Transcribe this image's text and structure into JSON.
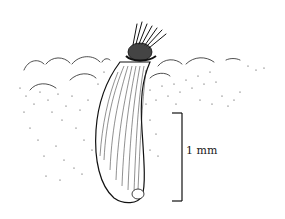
{
  "figure": {
    "scale_bar": {
      "label": "1 mm"
    },
    "colors": {
      "ink": "#111111",
      "background": "#ffffff"
    }
  }
}
